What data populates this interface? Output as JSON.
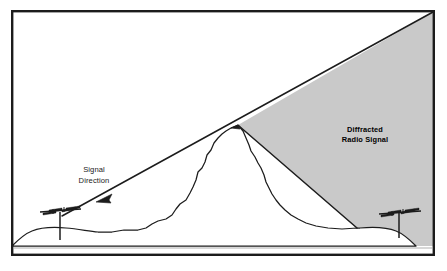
{
  "figure": {
    "width": 447,
    "height": 271,
    "background_color": "#ffffff",
    "frame": {
      "name": "outer-border",
      "stroke_color": "#1c1c1c",
      "stroke_width": 2.4,
      "x": 11,
      "y": 10,
      "width": 424,
      "height": 246
    },
    "baseline": {
      "name": "baseline-rule",
      "color": "#b0b0b0",
      "y": 248
    }
  },
  "labels": {
    "diffracted": {
      "line1": "Diffracted",
      "line2": "Radio Signal",
      "x": 365,
      "y": 132,
      "color": "#000000"
    },
    "signal_direction": {
      "line1": "Signal",
      "line2": "Direction",
      "x": 94,
      "y": 172,
      "color": "#1a1a1a"
    }
  },
  "geometry": {
    "shadow_region": {
      "name": "diffraction-shadow",
      "fill_color": "#c9c9c9",
      "stroke_color": "#1c1c1c",
      "description": "Gray wedge from mountain peak to upper-right corner and down to ground"
    },
    "signal_ray": {
      "name": "incident-signal-ray",
      "color": "#1c1c1c",
      "from_x": 62,
      "from_y": 216,
      "to_x": 433,
      "to_y": 12
    },
    "shadow_edge": {
      "name": "shadow-boundary-ray",
      "color": "#1c1c1c",
      "from_x": 240,
      "from_y": 129,
      "to_x": 357,
      "to_y": 228
    },
    "terrain": {
      "name": "terrain-profile",
      "color": "#1c1c1c",
      "peak_x": 238,
      "peak_y": 125
    },
    "arrow": {
      "name": "direction-arrowhead",
      "x": 103,
      "y": 198,
      "color": "#1c1c1c"
    }
  },
  "antennas": [
    {
      "name": "transmitting-antenna",
      "side": "left",
      "mast_x": 60,
      "mast_top_y": 212,
      "mast_bottom_y": 240,
      "boom_y": 212,
      "color": "#1c1c1c"
    },
    {
      "name": "receiving-antenna",
      "side": "right",
      "mast_x": 399,
      "mast_top_y": 213,
      "mast_bottom_y": 238,
      "boom_y": 213,
      "color": "#1c1c1c"
    }
  ],
  "colors": {
    "ink": "#1c1c1c",
    "shadow_gray": "#c9c9c9",
    "paper": "#ffffff",
    "rule_gray": "#b0b0b0"
  }
}
